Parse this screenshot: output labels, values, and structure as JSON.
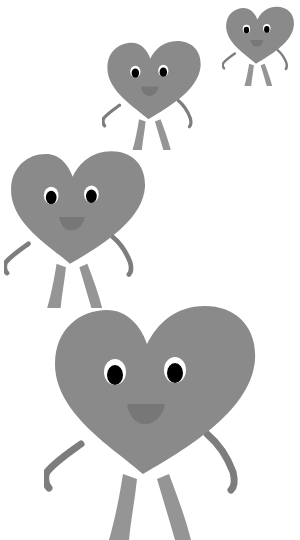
{
  "scene": {
    "description": "Four cartoon heart characters with eyes, nose, arms and legs",
    "colors": {
      "background": "#ffffff",
      "body": "#8a8a8a",
      "limbs": "#7d7d7d",
      "legs": "#959595",
      "nose": "#777777",
      "eye_white": "#ffffff",
      "pupil": "#000000"
    },
    "characters": [
      {
        "name": "heart-small-top-right",
        "left": 222,
        "top": 6,
        "width": 76,
        "height": 80
      },
      {
        "name": "heart-medium-top",
        "left": 102,
        "top": 40,
        "width": 104,
        "height": 110
      },
      {
        "name": "heart-large-middle",
        "left": 4,
        "top": 150,
        "width": 148,
        "height": 158
      },
      {
        "name": "heart-xlarge-bottom",
        "left": 44,
        "top": 304,
        "width": 222,
        "height": 236
      }
    ]
  }
}
